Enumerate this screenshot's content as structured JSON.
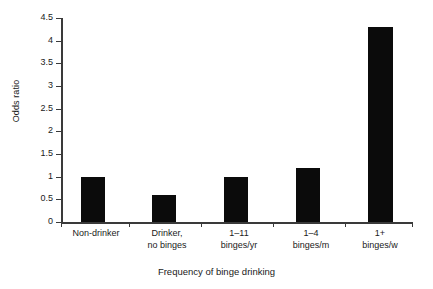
{
  "chart_data": {
    "type": "bar",
    "title": "",
    "subtitle": "",
    "xlabel": "Frequency of binge drinking",
    "ylabel": "Odds ratio",
    "categories": [
      "Non-drinker",
      "Drinker,\nno binges",
      "1–11\nbinges/yr",
      "1–4\nbinges/m",
      "1+\nbinges/w"
    ],
    "values": [
      1.0,
      0.6,
      1.0,
      1.2,
      4.3
    ],
    "ylim": [
      0,
      4.5
    ],
    "yticks": [
      0,
      0.5,
      1,
      1.5,
      2,
      2.5,
      3,
      3.5,
      4,
      4.5
    ],
    "ytick_labels": [
      "0",
      "0.5",
      "1",
      "1.5",
      "2",
      "2.5",
      "3",
      "3.5",
      "4",
      "4.5"
    ],
    "grid": false,
    "legend": null,
    "bar_color": "#0b0b0b",
    "axis_color": "#3a3a3a",
    "background": "#ffffff"
  }
}
